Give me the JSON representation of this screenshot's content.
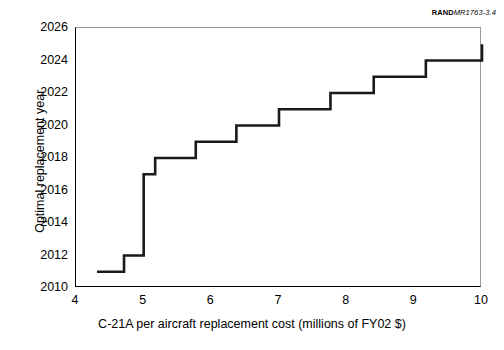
{
  "credit": {
    "org": "RAND",
    "document_number": "MR1763-3.4"
  },
  "chart_data": {
    "type": "line",
    "line_style": "step-post",
    "title": "",
    "subtitle": "",
    "xlabel": "C-21A per aircraft replacement cost (millions of FY02 $)",
    "ylabel": "Optimal replacement year",
    "xlim": [
      4,
      10
    ],
    "ylim": [
      2010,
      2026
    ],
    "xticks": [
      4,
      5,
      6,
      7,
      8,
      9,
      10
    ],
    "xtick_labels": [
      "4",
      "5",
      "6",
      "7",
      "8",
      "9",
      "10"
    ],
    "yticks": [
      2010,
      2012,
      2014,
      2016,
      2018,
      2020,
      2022,
      2024,
      2026
    ],
    "ytick_labels": [
      "2010",
      "2012",
      "2014",
      "2016",
      "2018",
      "2020",
      "2022",
      "2024",
      "2026"
    ],
    "grid": false,
    "legend": false,
    "legend_position": "none",
    "line_color": "#1a1a1a",
    "line_width": 2.6,
    "series": [
      {
        "name": "Optimal replacement year",
        "steps": [
          {
            "x_start": 4.31,
            "x_end": 4.71,
            "y": 2011
          },
          {
            "x_start": 4.71,
            "x_end": 5.0,
            "y": 2012
          },
          {
            "x_start": 5.0,
            "x_end": 5.17,
            "y": 2017
          },
          {
            "x_start": 5.17,
            "x_end": 5.77,
            "y": 2018
          },
          {
            "x_start": 5.77,
            "x_end": 6.37,
            "y": 2019
          },
          {
            "x_start": 6.37,
            "x_end": 7.0,
            "y": 2020
          },
          {
            "x_start": 7.0,
            "x_end": 7.76,
            "y": 2021
          },
          {
            "x_start": 7.76,
            "x_end": 8.4,
            "y": 2022
          },
          {
            "x_start": 8.4,
            "x_end": 9.17,
            "y": 2023
          },
          {
            "x_start": 9.17,
            "x_end": 10.0,
            "y": 2024
          },
          {
            "x_start": 10.0,
            "x_end": 10.0,
            "y": 2025
          }
        ],
        "x": [
          4.31,
          4.71,
          4.71,
          5.0,
          5.0,
          5.17,
          5.17,
          5.77,
          5.77,
          6.37,
          6.37,
          7.0,
          7.0,
          7.76,
          7.76,
          8.4,
          8.4,
          9.17,
          9.17,
          10.0,
          10.0
        ],
        "y": [
          2011,
          2011,
          2012,
          2012,
          2017,
          2017,
          2018,
          2018,
          2019,
          2019,
          2020,
          2020,
          2021,
          2021,
          2022,
          2022,
          2023,
          2023,
          2024,
          2024,
          2025
        ]
      }
    ]
  }
}
